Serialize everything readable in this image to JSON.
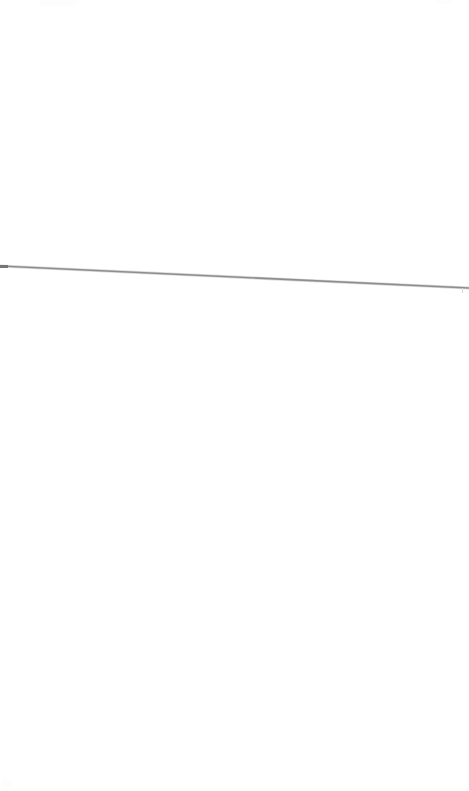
{
  "page": {
    "width": 469,
    "height": 791,
    "background_color": "#ffffff"
  },
  "content": {
    "empty_above_label": "",
    "empty_below_label": ""
  },
  "line": {
    "name": "horizontal-rule",
    "start_x": 0,
    "start_y": 266,
    "end_x": 469,
    "end_y": 288,
    "stroke_color": "#8e8e92",
    "stroke_color_edge": "#b4b4b8",
    "stroke_width": 1.6,
    "cap_color": "#76767a",
    "cap_x": 0,
    "cap_y": 265,
    "cap_width": 8,
    "cap_height": 3
  },
  "tick": {
    "name": "edge-tick-mark",
    "x": 462,
    "y": 288,
    "width": 1,
    "height": 5,
    "color": "#d8d8dc"
  }
}
